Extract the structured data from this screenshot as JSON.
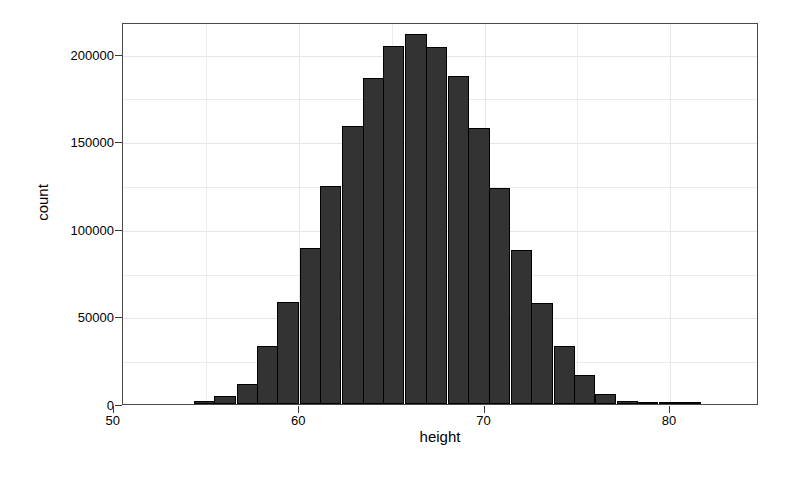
{
  "chart_data": {
    "type": "bar",
    "title": "",
    "subtitle": "",
    "xlabel": "height",
    "ylabel": "count",
    "xlim": [
      50.5,
      84.8
    ],
    "ylim": [
      0,
      218000
    ],
    "grid": true,
    "legend": "none",
    "bar_fill_color": "#333333",
    "bar_stroke_color": "#000000",
    "panel_background": "#ffffff",
    "grid_color": "#e8e8e8",
    "x_ticks": [
      50,
      60,
      70,
      80
    ],
    "x_tick_labels": [
      "50",
      "60",
      "70",
      "80"
    ],
    "y_ticks": [
      0,
      50000,
      100000,
      150000,
      200000
    ],
    "y_tick_labels": [
      "0",
      "50000",
      "100000",
      "150000",
      "200000"
    ],
    "x_minor_ticks": [
      55,
      65,
      75
    ],
    "y_minor_ticks": [
      25000,
      75000,
      125000,
      175000
    ],
    "bin_width": 1.143,
    "bin_centers": [
      54.9,
      56.0,
      57.2,
      58.3,
      59.4,
      60.6,
      61.7,
      62.9,
      64.0,
      65.1,
      66.3,
      67.4,
      68.6,
      69.7,
      70.8,
      72.0,
      73.1,
      74.3,
      75.4,
      76.5,
      77.7,
      78.8,
      80.0,
      81.1
    ],
    "categories": [
      "54.9",
      "56.0",
      "57.2",
      "58.3",
      "59.4",
      "60.6",
      "61.7",
      "62.9",
      "64.0",
      "65.1",
      "66.3",
      "67.4",
      "68.6",
      "69.7",
      "70.8",
      "72.0",
      "73.1",
      "74.3",
      "75.4",
      "76.5",
      "77.7",
      "78.8",
      "80.0",
      "81.1"
    ],
    "values": [
      1500,
      4500,
      11500,
      33000,
      58500,
      89000,
      124500,
      158500,
      186000,
      204500,
      211000,
      204000,
      187000,
      157500,
      123000,
      88000,
      57500,
      33000,
      16500,
      6000,
      2000,
      700,
      200,
      60
    ]
  }
}
